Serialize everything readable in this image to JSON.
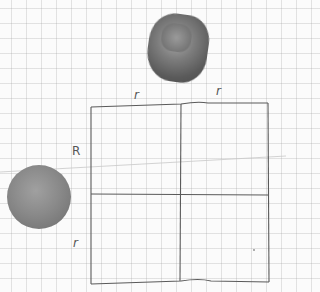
{
  "diagram": {
    "type": "hand-drawn geometry sketch on graph paper",
    "labels": {
      "top_left_r": "r",
      "top_right_r": "r",
      "left_R": "R",
      "left_r": "r"
    },
    "objects": {
      "cube": "rounded cube (shaded)",
      "sphere": "sphere (shaded)"
    },
    "colors": {
      "paper": "#fbfbfb",
      "grid": "#d8d8d8",
      "ink": "#555555",
      "shape_shading": "#7d7d7d"
    }
  }
}
